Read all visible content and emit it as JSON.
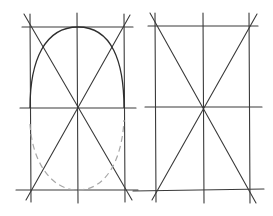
{
  "diagram": {
    "panels": [
      {
        "id": "left",
        "description": "rectangle grid with diagonals and a semi-ellipse arch; lower half of ellipse dashed",
        "verticals_x": [
          30,
          77,
          124
        ],
        "horizontals_y": [
          27,
          108,
          190
        ],
        "has_arch": true,
        "has_dashed_lower_ellipse": true
      },
      {
        "id": "right",
        "description": "rectangle grid with two diagonals crossing at center",
        "verticals_x": [
          155,
          203,
          249
        ],
        "horizontals_y": [
          26,
          107,
          190
        ],
        "has_arch": false,
        "has_dashed_lower_ellipse": false
      }
    ],
    "colors": {
      "line": "#3a3a3a",
      "arch": "#2e2e2e",
      "dashed": "#a8a8a8",
      "background": "#ffffff"
    }
  }
}
